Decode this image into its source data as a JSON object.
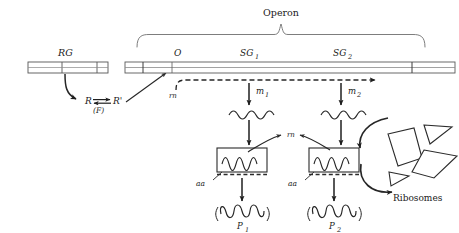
{
  "figure": {
    "title_label": "Operon",
    "background_color": "#ffffff",
    "ink_color": "#262626"
  },
  "regulator": {
    "gene_label": "RG",
    "repressor_label": "R",
    "repressor_active_label": "R'",
    "effector_label": "(F)"
  },
  "operon": {
    "bracket_label": "Operon",
    "segments": [
      {
        "id": "operator",
        "label": "O"
      },
      {
        "id": "structural-gene-1",
        "label": "SG",
        "subscript": "1"
      },
      {
        "id": "structural-gene-2",
        "label": "SG",
        "subscript": "2"
      }
    ]
  },
  "transcription": {
    "polymerase_label_left": "rn",
    "polymerase_label_center": "rn",
    "messengers": [
      {
        "id": "mrna-1",
        "label": "m",
        "subscript": "1"
      },
      {
        "id": "mrna-2",
        "label": "m",
        "subscript": "2"
      }
    ]
  },
  "translation": {
    "amino_acid_label_left": "aa",
    "amino_acid_label_right": "aa",
    "ribosomes_label": "Ribosomes",
    "proteins": [
      {
        "id": "protein-1",
        "label": "P",
        "subscript": "1"
      },
      {
        "id": "protein-2",
        "label": "P",
        "subscript": "2"
      }
    ]
  }
}
